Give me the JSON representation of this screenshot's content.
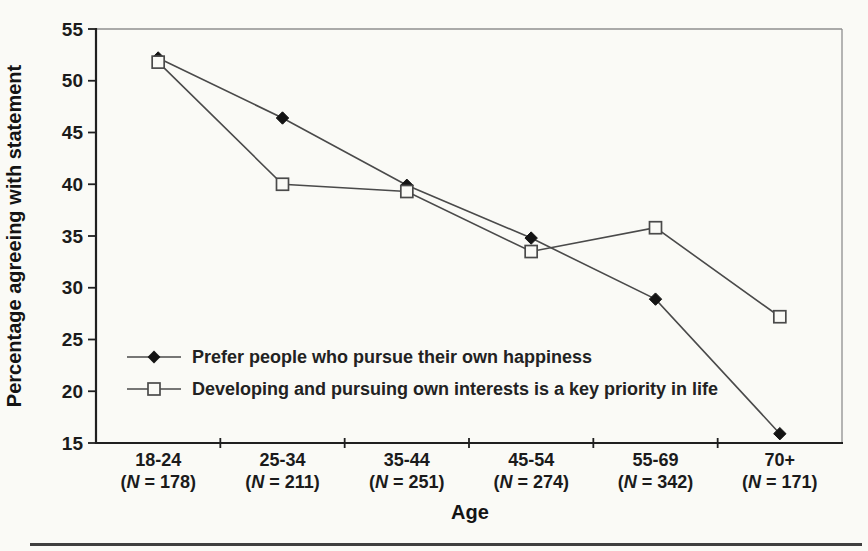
{
  "chart_data": {
    "type": "line",
    "xlabel": "Age",
    "ylabel": "Percentage agreeing with statement",
    "ylim": [
      15,
      55
    ],
    "yticks": [
      15,
      20,
      25,
      30,
      35,
      40,
      45,
      50,
      55
    ],
    "grid": false,
    "legend_position": "inside-lower-left",
    "categories": [
      {
        "label": "18-24",
        "n": "178"
      },
      {
        "label": "25-34",
        "n": "211"
      },
      {
        "label": "35-44",
        "n": "251"
      },
      {
        "label": "45-54",
        "n": "274"
      },
      {
        "label": "55-69",
        "n": "342"
      },
      {
        "label": "70+",
        "n": "171"
      }
    ],
    "n_symbol": "N",
    "series": [
      {
        "name": "Prefer people who pursue their own happiness",
        "marker": "filled-diamond",
        "values": [
          52.2,
          46.4,
          39.9,
          34.8,
          28.9,
          15.9
        ]
      },
      {
        "name": "Developing and pursuing own interests is a key priority in life",
        "marker": "open-square",
        "values": [
          51.8,
          40.0,
          39.3,
          33.5,
          35.8,
          27.2
        ]
      }
    ],
    "colors": {
      "line": "#4a4a4a",
      "axis": "#1f1f1f",
      "frame": "#8f8f8f",
      "marker_fill": "#141414",
      "open_marker_fill": "#fafaf6",
      "text": "#1b1b1b",
      "background": "#fafaf6",
      "bottom_rule": "#3f3f3f"
    }
  }
}
